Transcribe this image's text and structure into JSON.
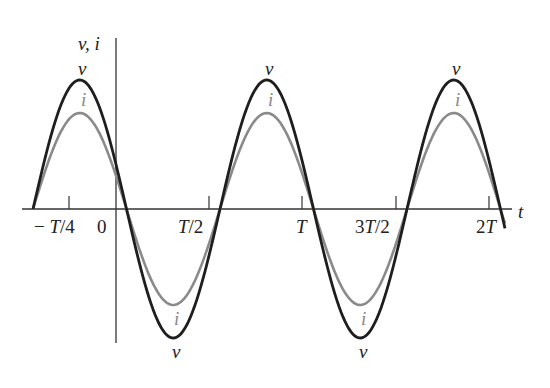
{
  "chart_data": {
    "type": "line",
    "title": "",
    "xlabel": "t",
    "ylabel": "v, i",
    "x_ticks": [
      "−T/4",
      "0",
      "T/2",
      "T",
      "3T/2",
      "2T"
    ],
    "x_tick_values_in_T": [
      -0.25,
      0,
      0.5,
      1,
      1.5,
      2
    ],
    "xlim_in_T": [
      -0.45,
      2.05
    ],
    "series": [
      {
        "name": "v",
        "color": "#222222",
        "amplitude": 1.0,
        "phase_note": "in phase with i",
        "peak_labels": "v"
      },
      {
        "name": "i",
        "color": "#888888",
        "amplitude": 0.75,
        "phase_note": "in phase with v",
        "peak_labels": "i"
      }
    ],
    "grid": false,
    "legend": "labels placed at each peak and trough"
  },
  "labels": {
    "y_axis": "v, i",
    "x_axis": "t",
    "v": "v",
    "i": "i",
    "ticks": {
      "neg_quarter": "− T/4",
      "zero": "0",
      "half": "T/2",
      "one": "T",
      "three_half": "3T/2",
      "two": "2T"
    }
  }
}
